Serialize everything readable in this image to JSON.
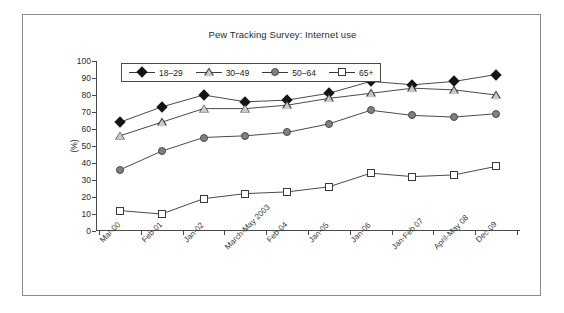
{
  "chart_data": {
    "type": "line",
    "title": "Pew Tracking Survey: Internet use",
    "xlabel": "",
    "ylabel": "(%)",
    "ylim": [
      0,
      100
    ],
    "yticks": [
      0,
      10,
      20,
      30,
      40,
      50,
      60,
      70,
      80,
      90,
      100
    ],
    "grid": false,
    "legend_position": "top-left-inside",
    "categories": [
      "Mar-00",
      "Feb-01",
      "Jan-02",
      "March-May 2003",
      "Feb-04",
      "Jan-05",
      "Jan-06",
      "Jan-Feb 07",
      "April-May 08",
      "Dec-09"
    ],
    "series": [
      {
        "name": "18–29",
        "marker": "diamond-filled-black",
        "color": "#141414",
        "values": [
          64,
          73,
          80,
          76,
          77,
          81,
          88,
          86,
          88,
          92
        ]
      },
      {
        "name": "30–49",
        "marker": "triangle-gray-outlined",
        "color": "#c9c9c9",
        "values": [
          56,
          64,
          72,
          72,
          74,
          78,
          81,
          84,
          83,
          80
        ]
      },
      {
        "name": "50–64",
        "marker": "circle-gray",
        "color": "#808080",
        "values": [
          36,
          47,
          55,
          56,
          58,
          63,
          71,
          68,
          67,
          69
        ]
      },
      {
        "name": "65+",
        "marker": "square-open-white",
        "color": "#ffffff",
        "values": [
          12,
          10,
          19,
          22,
          23,
          26,
          34,
          32,
          33,
          38
        ]
      }
    ]
  },
  "figure": {
    "frame_color": "#8b8b8b",
    "axis_color": "#4a4a4a",
    "background": "#ffffff"
  }
}
